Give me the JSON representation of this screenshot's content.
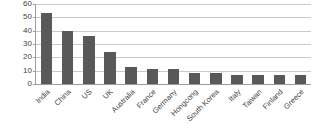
{
  "chart_data": {
    "type": "bar",
    "title": "",
    "xlabel": "",
    "ylabel": "No of Document",
    "ylim": [
      0,
      60
    ],
    "yticks": [
      60,
      50,
      40,
      30,
      20,
      10,
      0
    ],
    "grid": true,
    "legend": false,
    "bar_color": "#595959",
    "gridline_color": "#c9c9c9",
    "axis_color": "#9c9c9c",
    "categories": [
      "India",
      "China",
      "US",
      "UK",
      "Australia",
      "France",
      "Germany",
      "Hongcong",
      "South Korea",
      "Italy",
      "Taiwan",
      "Finland",
      "Greece"
    ],
    "values": [
      53,
      40,
      36,
      24,
      13,
      11.5,
      11.5,
      8.5,
      8.5,
      7,
      7,
      6.5,
      6.5
    ]
  }
}
